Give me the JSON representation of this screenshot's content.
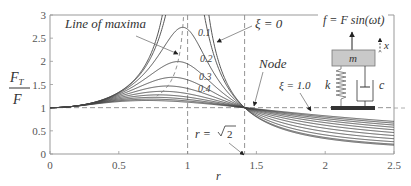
{
  "chart_data": {
    "type": "line",
    "title": "",
    "xlabel": "r",
    "ylabel": "F_T / F",
    "ylabel_num": "F",
    "ylabel_num_sub": "T",
    "ylabel_den": "F",
    "xlim": [
      0,
      2.5
    ],
    "ylim": [
      0,
      3
    ],
    "xticks": [
      0,
      0.5,
      1,
      1.5,
      2,
      2.5
    ],
    "xtick_labels": [
      "0",
      "0.5",
      "1",
      "1.5",
      "2",
      "2.5"
    ],
    "yticks": [
      0,
      0.5,
      1,
      1.5,
      2,
      2.5,
      3
    ],
    "ytick_labels": [
      "0",
      "0.5",
      "1",
      "1.5",
      "2",
      "2.5",
      "3"
    ],
    "grid": false,
    "formula": "F_T/F = sqrt(1 + (2 xi r)^2) / sqrt((1 - r^2)^2 + (2 xi r)^2)",
    "series": [
      {
        "name": "ξ=0",
        "xi": 0.0
      },
      {
        "name": "ξ=0.1",
        "xi": 0.1
      },
      {
        "name": "ξ=0.2",
        "xi": 0.2
      },
      {
        "name": "ξ=0.3",
        "xi": 0.3
      },
      {
        "name": "ξ=0.4",
        "xi": 0.4
      },
      {
        "name": "ξ=0.5",
        "xi": 0.5
      },
      {
        "name": "ξ=0.6",
        "xi": 0.6
      },
      {
        "name": "ξ=0.7",
        "xi": 0.7
      },
      {
        "name": "ξ=0.8",
        "xi": 0.8
      },
      {
        "name": "ξ=0.9",
        "xi": 0.9
      },
      {
        "name": "ξ=1.0",
        "xi": 1.0
      }
    ],
    "reference_lines": [
      {
        "type": "horizontal",
        "y": 1,
        "style": "dashed"
      },
      {
        "type": "vertical",
        "x": 1,
        "style": "dashed"
      },
      {
        "type": "vertical",
        "x": 1.4142,
        "style": "dashed"
      }
    ],
    "annotations": {
      "line_of_maxima": "Line of maxima",
      "xi_zero": "ξ = 0",
      "xi_one": "ξ = 1.0",
      "node": "Node",
      "r_sqrt2_prefix": "r = ",
      "r_sqrt2_value": "2",
      "damping_labels": [
        "0.1",
        "0.2",
        "0.3",
        "0.4"
      ]
    },
    "inset": {
      "force_equation": "f = F sin(ωt)",
      "mass": "m",
      "spring": "k",
      "damper": "c",
      "displacement": "x"
    }
  }
}
